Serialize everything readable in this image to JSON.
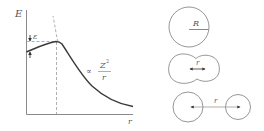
{
  "figure": {
    "plot": {
      "y_axis_label": "E",
      "x_axis_label": "r",
      "barrier_label": "ε",
      "coulomb_label_prefix": "∝",
      "coulomb_label_numerator": "Z²",
      "coulomb_label_numerator_base": "Z",
      "coulomb_label_numerator_exp": "2",
      "coulomb_label_denominator": "r"
    },
    "stages": [
      {
        "name": "spherical-nucleus",
        "label": "R"
      },
      {
        "name": "deformed-nucleus",
        "label": "r"
      },
      {
        "name": "separated-fragments",
        "label": "r"
      }
    ],
    "colors": {
      "curve": "#3a3a3a",
      "axis": "#8a8a8a",
      "dashed": "#9a9a9a",
      "circle": "#8a8a8a",
      "text": "#555555"
    }
  }
}
